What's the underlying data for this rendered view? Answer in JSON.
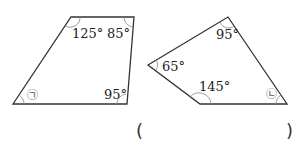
{
  "figures": [
    {
      "name": "quadrilateral-a",
      "vertices": [
        [
          13,
          104
        ],
        [
          71,
          17
        ],
        [
          134,
          17
        ],
        [
          127,
          104
        ]
      ],
      "angles": [
        {
          "label": "125°",
          "vertex": "top-left"
        },
        {
          "label": "85°",
          "vertex": "top-right"
        },
        {
          "label": "95°",
          "vertex": "bottom-right"
        },
        {
          "label": "㉠",
          "vertex": "bottom-left",
          "unknown": true
        }
      ]
    },
    {
      "name": "quadrilateral-b",
      "vertices": [
        [
          148,
          65
        ],
        [
          228,
          17
        ],
        [
          287,
          104
        ],
        [
          200,
          104
        ]
      ],
      "angles": [
        {
          "label": "95°",
          "vertex": "top"
        },
        {
          "label": "65°",
          "vertex": "left"
        },
        {
          "label": "145°",
          "vertex": "bottom-left"
        },
        {
          "label": "㉡",
          "vertex": "bottom-right",
          "unknown": true
        }
      ]
    }
  ],
  "answer": {
    "open": "(",
    "close": ")",
    "value": ""
  }
}
